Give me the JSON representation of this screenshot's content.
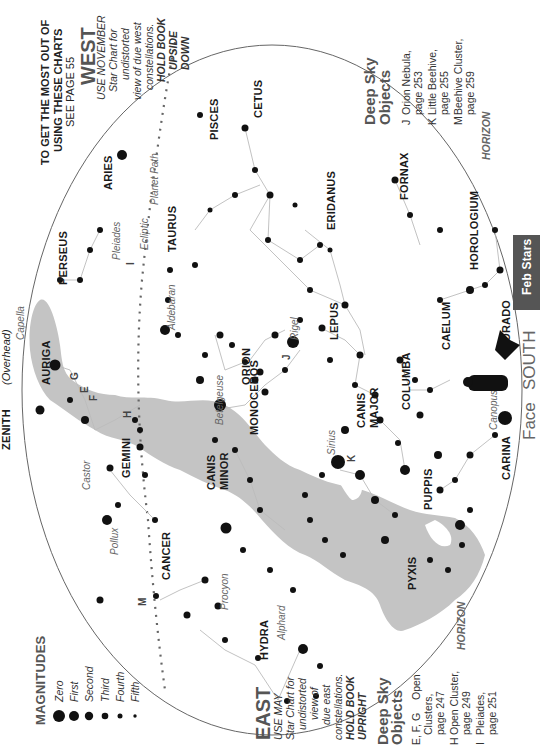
{
  "header": {
    "line1": "TO GET THE MOST OUT OF",
    "line2": "USING THESE CHARTS",
    "line3": "SEE PAGE 55"
  },
  "tab": {
    "label": "Feb Stars",
    "color": "#555555"
  },
  "zenith": {
    "label": "ZENITH",
    "sub": "(Overhead)"
  },
  "face": {
    "prefix": "Face",
    "direction": "SOUTH"
  },
  "west": {
    "title": "WEST",
    "lines": [
      "USE NOVEMBER",
      "Star Chart for",
      "undistorted",
      "view of due west",
      "constellations.",
      "HOLD BOOK",
      "UPSIDE",
      "DOWN"
    ]
  },
  "east": {
    "title": "EAST",
    "lines": [
      "USE MAY",
      "Star Chart for",
      "undistorted",
      "view of",
      "due east",
      "constellations.",
      "HOLD BOOK",
      "UPRIGHT"
    ]
  },
  "horizon_label": "HORIZON",
  "magnitudes": {
    "title": "MAGNITUDES",
    "items": [
      {
        "label": "Zero",
        "size": 6
      },
      {
        "label": "First",
        "size": 5
      },
      {
        "label": "Second",
        "size": 4.2
      },
      {
        "label": "Third",
        "size": 3.3
      },
      {
        "label": "Fourth",
        "size": 2.5
      },
      {
        "label": "Fifth",
        "size": 1.7
      }
    ]
  },
  "deep_sky_left": {
    "title1": "Deep Sky",
    "title2": "Objects",
    "items": [
      {
        "key": "E, F, G",
        "l1": "Open",
        "l2": "Clusters,",
        "l3": "page 247"
      },
      {
        "key": "H",
        "l1": "Open Cluster,",
        "l2": "page 249"
      },
      {
        "key": "I",
        "l1": "Pleiades,",
        "l2": "page 251"
      }
    ]
  },
  "deep_sky_right": {
    "title1": "Deep Sky",
    "title2": "Objects",
    "items": [
      {
        "key": "J",
        "l1": "Orion Nebula,",
        "l2": "page 253"
      },
      {
        "key": "K",
        "l1": "Little Beehive,",
        "l2": "page 255"
      },
      {
        "key": "M",
        "l1": "Beehive Cluster,",
        "l2": "page 259"
      }
    ]
  },
  "paths": {
    "ecliptic": "Ecliptic",
    "planet": "Planet Path"
  },
  "constellations": [
    {
      "name": "PISCES",
      "x": 218,
      "y": 140
    },
    {
      "name": "CETUS",
      "x": 262,
      "y": 118
    },
    {
      "name": "ARIES",
      "x": 112,
      "y": 190
    },
    {
      "name": "PERSEUS",
      "x": 67,
      "y": 285
    },
    {
      "name": "TAURUS",
      "x": 176,
      "y": 252
    },
    {
      "name": "ERIDANUS",
      "x": 335,
      "y": 230
    },
    {
      "name": "FORNAX",
      "x": 408,
      "y": 200
    },
    {
      "name": "HOROLOGIUM",
      "x": 478,
      "y": 270
    },
    {
      "name": "DORADO",
      "x": 510,
      "y": 350
    },
    {
      "name": "AURIGA",
      "x": 50,
      "y": 385
    },
    {
      "name": "ORION",
      "x": 250,
      "y": 385
    },
    {
      "name": "LEPUS",
      "x": 338,
      "y": 340
    },
    {
      "name": "CAELUM",
      "x": 450,
      "y": 350
    },
    {
      "name": "COLUMBA",
      "x": 410,
      "y": 410
    },
    {
      "name": "MONOCEROS",
      "x": 258,
      "y": 435
    },
    {
      "name": "GEMINI",
      "x": 130,
      "y": 478
    },
    {
      "name": "CANIS",
      "x": 215,
      "y": 490
    },
    {
      "name": "MINOR",
      "x": 228,
      "y": 490
    },
    {
      "name": "CANIS",
      "x": 365,
      "y": 428
    },
    {
      "name": "MAJOR",
      "x": 378,
      "y": 428
    },
    {
      "name": "PUPPIS",
      "x": 432,
      "y": 510
    },
    {
      "name": "CARINA",
      "x": 510,
      "y": 480
    },
    {
      "name": "PYXIS",
      "x": 416,
      "y": 590
    },
    {
      "name": "CANCER",
      "x": 170,
      "y": 580
    },
    {
      "name": "HYDRA",
      "x": 268,
      "y": 660
    }
  ],
  "star_names": [
    {
      "name": "Capella",
      "x": 24,
      "y": 340
    },
    {
      "name": "Pleiades",
      "x": 120,
      "y": 260
    },
    {
      "name": "Aldebaran",
      "x": 175,
      "y": 330
    },
    {
      "name": "Rigel",
      "x": 298,
      "y": 340
    },
    {
      "name": "Betelgeuse",
      "x": 223,
      "y": 425
    },
    {
      "name": "Castor",
      "x": 90,
      "y": 490
    },
    {
      "name": "Pollux",
      "x": 118,
      "y": 555
    },
    {
      "name": "Sirius",
      "x": 335,
      "y": 455
    },
    {
      "name": "Procyon",
      "x": 228,
      "y": 610
    },
    {
      "name": "Alphard",
      "x": 285,
      "y": 640
    },
    {
      "name": "Canopus",
      "x": 497,
      "y": 430
    }
  ],
  "dso_labels": [
    {
      "k": "E",
      "x": 88,
      "y": 393
    },
    {
      "k": "G",
      "x": 78,
      "y": 380
    },
    {
      "k": "F",
      "x": 97,
      "y": 401
    },
    {
      "k": "H",
      "x": 131,
      "y": 418
    },
    {
      "k": "I",
      "x": 134,
      "y": 265
    },
    {
      "k": "J",
      "x": 290,
      "y": 360
    },
    {
      "k": "K",
      "x": 355,
      "y": 462
    },
    {
      "k": "M",
      "x": 146,
      "y": 606
    }
  ]
}
